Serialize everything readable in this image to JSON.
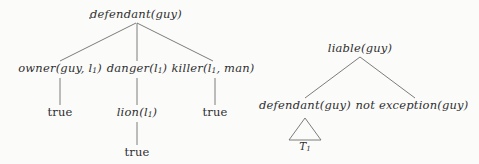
{
  "figure": {
    "background_color": "#fbfbfa",
    "line_color": "#6d6d6d",
    "text_color": "#2f2f2f"
  },
  "left_tree": {
    "name": "defendant-proof-tree",
    "root": {
      "text": "defendant(guy)",
      "x": 136,
      "y": 14
    },
    "stray_mark": {
      "x": 89,
      "y": 17
    },
    "children": [
      {
        "text": "owner(guy, l",
        "sub": "1",
        "tail": ")",
        "x": 60,
        "y": 68,
        "child": {
          "text": "true",
          "x": 60,
          "y": 112,
          "style": "upright"
        }
      },
      {
        "text": "danger(l",
        "sub": "1",
        "tail": ")",
        "x": 137,
        "y": 68,
        "child": {
          "text": "lion(l",
          "sub": "1",
          "tail": ")",
          "x": 137,
          "y": 112,
          "child": {
            "text": "true",
            "x": 137,
            "y": 152,
            "style": "upright"
          }
        }
      },
      {
        "text": "killer(l",
        "sub": "1",
        "tail": ", man)",
        "x": 213,
        "y": 68,
        "child": {
          "text": "true",
          "x": 215,
          "y": 112,
          "style": "upright"
        }
      }
    ]
  },
  "right_tree": {
    "name": "liable-proof-tree",
    "root": {
      "text": "liable(guy)",
      "x": 360,
      "y": 48
    },
    "children": [
      {
        "text": "defendant(guy)",
        "x": 305,
        "y": 105,
        "triangle": {
          "cx": 305,
          "top_y": 118,
          "base_y": 140,
          "half_width": 16
        },
        "triangle_label": {
          "text": "T",
          "sub": "1",
          "x": 305,
          "y": 140
        }
      },
      {
        "text": "not exception(guy)",
        "x": 412,
        "y": 105
      }
    ]
  },
  "edges": [
    {
      "from": "defendant(guy)",
      "to": "owner(guy, l1)",
      "x1": 136,
      "y1": 23,
      "x2": 60,
      "y2": 61
    },
    {
      "from": "defendant(guy)",
      "to": "danger(l1)",
      "x1": 137,
      "y1": 23,
      "x2": 137,
      "y2": 61
    },
    {
      "from": "defendant(guy)",
      "to": "killer(l1, man)",
      "x1": 137,
      "y1": 23,
      "x2": 213,
      "y2": 61
    },
    {
      "from": "owner(guy, l1)",
      "to": "true-left",
      "x1": 60,
      "y1": 78,
      "x2": 60,
      "y2": 105
    },
    {
      "from": "danger(l1)",
      "to": "lion(l1)",
      "x1": 137,
      "y1": 78,
      "x2": 137,
      "y2": 105
    },
    {
      "from": "killer(l1, man)",
      "to": "true-right",
      "x1": 215,
      "y1": 78,
      "x2": 215,
      "y2": 105
    },
    {
      "from": "lion(l1)",
      "to": "true-bottom",
      "x1": 137,
      "y1": 122,
      "x2": 137,
      "y2": 145
    },
    {
      "from": "liable(guy)",
      "to": "defendant(guy)",
      "x1": 360,
      "y1": 57,
      "x2": 305,
      "y2": 98
    },
    {
      "from": "liable(guy)",
      "to": "not exception(guy)",
      "x1": 360,
      "y1": 57,
      "x2": 415,
      "y2": 98
    }
  ]
}
